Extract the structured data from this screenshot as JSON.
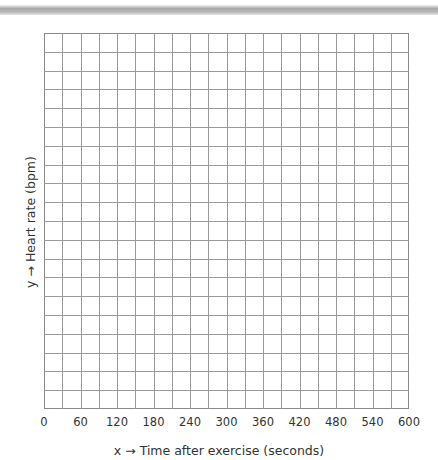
{
  "chart_data": {
    "type": "line",
    "title": "",
    "xlabel": "x → Time after exercise (seconds)",
    "ylabel": "y → Heart rate (bpm)",
    "x_tick_labels": [
      "0",
      "60",
      "120",
      "180",
      "240",
      "300",
      "360",
      "420",
      "480",
      "540",
      "600"
    ],
    "y_tick_labels": [],
    "xlim": [
      0,
      600
    ],
    "x_minor_step": 30,
    "grid": true,
    "grid_columns": 20,
    "grid_rows": 20,
    "series": [],
    "legend": null,
    "note": "Blank graph grid with no plotted data"
  },
  "colors": {
    "grid_line": "#9a9a9a",
    "border": "#8a8a8a",
    "text": "#333333"
  }
}
